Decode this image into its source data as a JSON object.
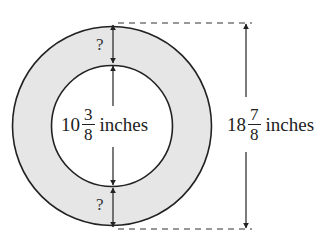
{
  "diagram": {
    "type": "annulus-dimension-diagram",
    "colors": {
      "ring_fill": "#e6e6e6",
      "stroke": "#222222",
      "inner_fill": "#ffffff",
      "background": "#ffffff"
    },
    "outer_diameter": {
      "whole": "18",
      "numerator": "7",
      "denominator": "8",
      "unit": "inches"
    },
    "inner_diameter": {
      "whole": "10",
      "numerator": "3",
      "denominator": "8",
      "unit": "inches"
    },
    "unknown_top": "?",
    "unknown_bottom": "?"
  }
}
